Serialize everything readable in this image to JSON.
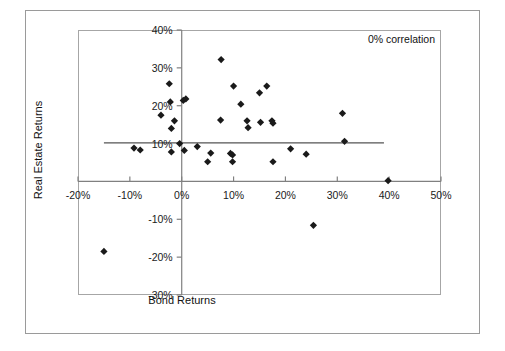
{
  "chart_data": {
    "type": "scatter",
    "title": "",
    "xlabel": "Bond Returns",
    "ylabel": "Real Estate Returns",
    "xlim": [
      -20,
      50
    ],
    "ylim": [
      -30,
      40
    ],
    "xticks": [
      "-20%",
      "-10%",
      "0%",
      "10%",
      "20%",
      "30%",
      "40%",
      "50%"
    ],
    "xtick_values": [
      -20,
      -10,
      0,
      10,
      20,
      30,
      40,
      50
    ],
    "yticks": [
      "40%",
      "30%",
      "20%",
      "10%",
      "-10%",
      "-20%",
      "-30%"
    ],
    "ytick_values": [
      40,
      30,
      20,
      10,
      -10,
      -20,
      -30
    ],
    "grid": false,
    "legend": "none",
    "annotation": "0% correlation",
    "annotation_position": "top-right",
    "marker": "diamond",
    "marker_color": "#1a1a1a",
    "axis_color": "#808080",
    "trendline": {
      "label": "trendline",
      "color": "#555555",
      "x_start": -15,
      "x_end": 39,
      "y_start": 10.2,
      "y_end": 10.2
    },
    "points": [
      {
        "x": -15.0,
        "y": -18.5
      },
      {
        "x": -9.2,
        "y": 8.8
      },
      {
        "x": -8.0,
        "y": 8.3
      },
      {
        "x": -4.0,
        "y": 17.5
      },
      {
        "x": -2.4,
        "y": 25.8
      },
      {
        "x": -2.2,
        "y": 21.0
      },
      {
        "x": -2.0,
        "y": 14.0
      },
      {
        "x": -2.0,
        "y": 7.8
      },
      {
        "x": -1.4,
        "y": 16.0
      },
      {
        "x": -0.4,
        "y": 10.0
      },
      {
        "x": 0.3,
        "y": 21.4
      },
      {
        "x": 0.8,
        "y": 21.8
      },
      {
        "x": 0.5,
        "y": 8.2
      },
      {
        "x": 3.0,
        "y": 9.2
      },
      {
        "x": 5.0,
        "y": 5.2
      },
      {
        "x": 5.6,
        "y": 7.5
      },
      {
        "x": 7.6,
        "y": 32.2
      },
      {
        "x": 7.5,
        "y": 16.2
      },
      {
        "x": 9.4,
        "y": 7.4
      },
      {
        "x": 9.8,
        "y": 7.0
      },
      {
        "x": 9.8,
        "y": 5.2
      },
      {
        "x": 10.0,
        "y": 25.2
      },
      {
        "x": 11.4,
        "y": 20.4
      },
      {
        "x": 12.6,
        "y": 16.0
      },
      {
        "x": 12.8,
        "y": 14.2
      },
      {
        "x": 15.0,
        "y": 23.4
      },
      {
        "x": 15.2,
        "y": 15.6
      },
      {
        "x": 16.4,
        "y": 25.2
      },
      {
        "x": 17.4,
        "y": 16.0
      },
      {
        "x": 17.6,
        "y": 15.4
      },
      {
        "x": 17.6,
        "y": 5.2
      },
      {
        "x": 21.0,
        "y": 8.6
      },
      {
        "x": 24.0,
        "y": 7.2
      },
      {
        "x": 25.4,
        "y": -11.6
      },
      {
        "x": 31.0,
        "y": 18.0
      },
      {
        "x": 31.4,
        "y": 10.6
      },
      {
        "x": 39.8,
        "y": 0.2
      }
    ]
  },
  "figure": {
    "annotation": "0% correlation",
    "x_axis_title": "Bond Returns",
    "y_axis_title": "Real Estate Returns",
    "x_tick_labels": [
      "-20%",
      "-10%",
      "0%",
      "10%",
      "20%",
      "30%",
      "40%",
      "50%"
    ],
    "y_tick_labels": [
      "40%",
      "30%",
      "20%",
      "10%",
      "-10%",
      "-20%",
      "-30%"
    ]
  }
}
